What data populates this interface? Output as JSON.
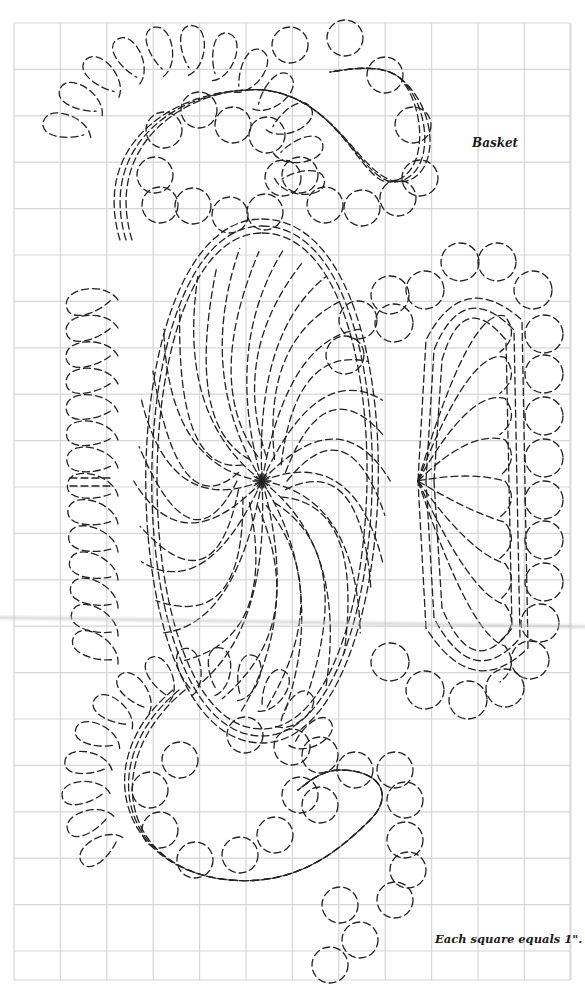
{
  "diagram": {
    "title": "Basket",
    "scale_note": "Each square equals 1\".",
    "type": "quilting-pattern",
    "grid": {
      "left": 14,
      "top": 23,
      "right": 570,
      "bottom": 980,
      "cell_size": 46.4,
      "columns": 12,
      "line_color": "#d4d4d4"
    },
    "stroke": {
      "color": "#222222",
      "dash": "7 4",
      "width": 1.3
    },
    "elements": {
      "main_oval": "large feathered oval with pinwheel center",
      "pinwheel_center": [
        262,
        481
      ],
      "right_fan": "tall rounded-rectangle column with fan of feathers radiating from left midpoint",
      "right_fan_origin": [
        418,
        481
      ],
      "top_curl": "feathered scroll curl at top with circle echoes",
      "bottom_curl": "feathered scroll curl at bottom with circle echoes",
      "left_feathers": "feather plumes along left side of main oval"
    }
  }
}
